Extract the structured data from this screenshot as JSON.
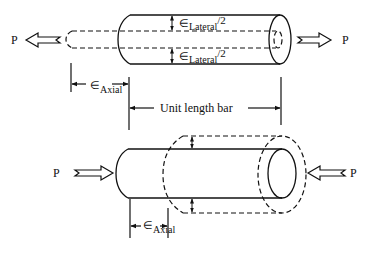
{
  "diagram": {
    "type": "strain illustration",
    "colors": {
      "stroke": "#111111",
      "background": "#ffffff"
    },
    "tension": {
      "load_left": "P",
      "load_right": "P",
      "lateral_top_symbol": "∈",
      "lateral_top_sub": "Lateral",
      "lateral_top_tail": "/2",
      "lateral_bottom_symbol": "∈",
      "lateral_bottom_sub": "Lateral",
      "lateral_bottom_tail": "/2",
      "axial_symbol": "∈",
      "axial_sub": "Axial",
      "unit_length_label": "Unit length bar"
    },
    "compression": {
      "load_left": "P",
      "load_right": "P",
      "axial_symbol": "∈",
      "axial_sub": "Axial"
    }
  }
}
